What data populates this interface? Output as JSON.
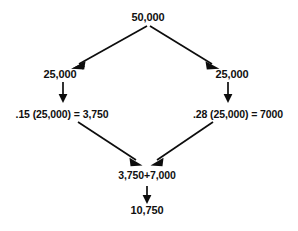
{
  "diagram": {
    "type": "flowchart",
    "background_color": "#ffffff",
    "text_color": "#101010",
    "arrow_color": "#0d0d0d",
    "nodes": {
      "root": "50,000",
      "left_half": "25,000",
      "right_half": "25,000",
      "left_calc": ".15 (25,000) = 3,750",
      "right_calc": ".28 (25,000) = 7000",
      "sum": "3,750+7,000",
      "total": "10,750"
    }
  }
}
